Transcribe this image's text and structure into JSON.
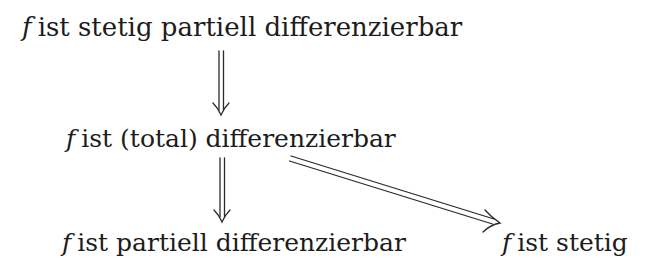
{
  "diagram": {
    "nodes": [
      {
        "id": "stetig-partiell",
        "var": "f",
        "label": "ist stetig partiell differenzierbar"
      },
      {
        "id": "total",
        "var": "f",
        "label": "ist (total) differenzierbar"
      },
      {
        "id": "partiell",
        "var": "f",
        "label": "ist partiell differenzierbar"
      },
      {
        "id": "stetig",
        "var": "f",
        "label": "ist stetig"
      }
    ],
    "edges": [
      {
        "from": "stetig-partiell",
        "to": "total",
        "style": "double-arrow (implies)"
      },
      {
        "from": "total",
        "to": "partiell",
        "style": "double-arrow (implies)"
      },
      {
        "from": "total",
        "to": "stetig",
        "style": "double-arrow (implies)"
      }
    ],
    "colors": {
      "text": "#1c1c1c",
      "arrow": "#2a2a2a",
      "background": "#ffffff"
    }
  }
}
